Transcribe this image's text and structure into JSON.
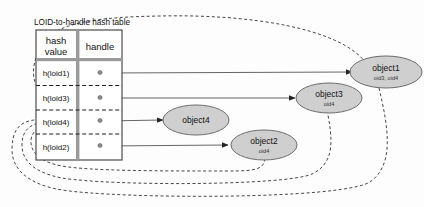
{
  "diagram": {
    "caption": "LOID-to-handle  hash table",
    "table": {
      "columns": [
        {
          "id": "hash-value",
          "line1": "hash",
          "line2": "value"
        },
        {
          "id": "handle",
          "line1": "handle",
          "line2": ""
        }
      ],
      "rows": [
        {
          "hash": "h(loid1)",
          "handle_marker": "dot"
        },
        {
          "hash": "h(loid3)",
          "handle_marker": "dot"
        },
        {
          "hash": "h(loid4)",
          "handle_marker": "dot"
        },
        {
          "hash": "h(loid2)",
          "handle_marker": "dot"
        }
      ]
    },
    "objects": [
      {
        "id": "object1",
        "label": "object1",
        "sub": "oid3, oid4"
      },
      {
        "id": "object3",
        "label": "object3",
        "sub": "oid4"
      },
      {
        "id": "object4",
        "label": "object4",
        "sub": ""
      },
      {
        "id": "object2",
        "label": "object2",
        "sub": "oid4"
      }
    ],
    "handle_links": [
      {
        "from": "h(loid1)",
        "to": "object1"
      },
      {
        "from": "h(loid3)",
        "to": "object3"
      },
      {
        "from": "h(loid4)",
        "to": "object4"
      },
      {
        "from": "h(loid2)",
        "to": "object2"
      }
    ],
    "reference_links": [
      {
        "from": "object1",
        "to": "h(loid3)"
      },
      {
        "from": "object1",
        "to": "h(loid4)"
      },
      {
        "from": "object3",
        "to": "h(loid4)"
      },
      {
        "from": "object2",
        "to": "h(loid4)"
      }
    ],
    "colors": {
      "object_fill": "#cfcfcf",
      "object_stroke": "#6b6b6b",
      "table_stroke": "#3b3b3b",
      "divider": "#9a9a9a",
      "background": "#fdfdfd"
    }
  }
}
